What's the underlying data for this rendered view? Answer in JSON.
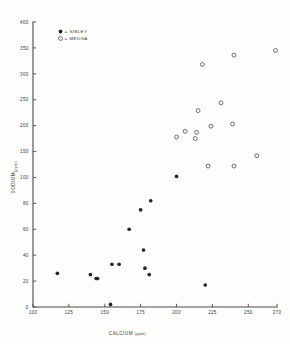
{
  "chart_data": {
    "type": "scatter",
    "title": "",
    "xlabel": "CALCIUM",
    "xunit": "(ppm)",
    "ylabel": "SODIUM",
    "yunit": "(ppm)",
    "xlim": [
      100,
      270
    ],
    "ylim": [
      0,
      400
    ],
    "grid": false,
    "legend_position": "top-left inside axes",
    "xticks": [
      100,
      125,
      150,
      175,
      200,
      225,
      250,
      270
    ],
    "xticklabels": [
      "100",
      "125",
      "150",
      "175",
      "200",
      "225",
      "250",
      "270"
    ],
    "yticks": [
      0,
      20,
      40,
      60,
      80,
      100,
      150,
      200,
      250,
      300,
      350,
      400
    ],
    "yticklabels": [
      "0",
      "20",
      "40",
      "60",
      "80",
      "100",
      "150",
      "200",
      "250",
      "300",
      "350",
      "400"
    ],
    "y_axis_note": "broken / compressed scale: 0-100 expanded in equal 20-unit steps, 100-400 in equal 50-unit steps",
    "series": [
      {
        "name": "SIBLEY",
        "marker": "filled-circle",
        "color": "#262626",
        "points": [
          {
            "x": 117,
            "y": 26
          },
          {
            "x": 140,
            "y": 25
          },
          {
            "x": 144,
            "y": 22
          },
          {
            "x": 145,
            "y": 22
          },
          {
            "x": 154,
            "y": 2
          },
          {
            "x": 155,
            "y": 33
          },
          {
            "x": 160,
            "y": 33
          },
          {
            "x": 167,
            "y": 60
          },
          {
            "x": 175,
            "y": 75
          },
          {
            "x": 177,
            "y": 44
          },
          {
            "x": 178,
            "y": 30
          },
          {
            "x": 181,
            "y": 25
          },
          {
            "x": 182,
            "y": 82
          },
          {
            "x": 200,
            "y": 102
          },
          {
            "x": 220,
            "y": 17
          }
        ]
      },
      {
        "name": "MEDGA",
        "marker": "open-circle",
        "color": "#55555a",
        "points": [
          {
            "x": 200,
            "y": 178
          },
          {
            "x": 206,
            "y": 189
          },
          {
            "x": 213,
            "y": 175
          },
          {
            "x": 214,
            "y": 187
          },
          {
            "x": 215,
            "y": 229
          },
          {
            "x": 218,
            "y": 318
          },
          {
            "x": 222,
            "y": 122
          },
          {
            "x": 224,
            "y": 199
          },
          {
            "x": 231,
            "y": 244
          },
          {
            "x": 239,
            "y": 203
          },
          {
            "x": 240,
            "y": 336
          },
          {
            "x": 240,
            "y": 122
          },
          {
            "x": 256,
            "y": 142
          },
          {
            "x": 269,
            "y": 345
          }
        ]
      }
    ],
    "legend": [
      {
        "label": "SIBLEY",
        "marker": "filled-circle"
      },
      {
        "label": "MEDGA",
        "marker": "open-circle"
      }
    ]
  }
}
